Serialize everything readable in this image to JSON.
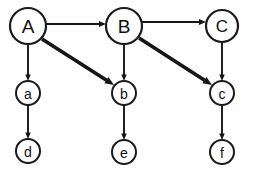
{
  "diagram": {
    "type": "directed-graph",
    "canvas": {
      "width": 254,
      "height": 175,
      "background": "#fefefe"
    },
    "style": {
      "node_fill": "#ffffff",
      "node_stroke": "#1a1a1a",
      "label_color": "#111111",
      "edge_color": "#161616",
      "thin_edge_width": 1.9,
      "thick_edge_width": 3.6,
      "major_node_stroke_width": 2.2,
      "minor_node_stroke_width": 2.0
    },
    "nodes": [
      {
        "id": "A",
        "label": "A",
        "cx": 28,
        "cy": 26,
        "r": 18,
        "tier": "major",
        "font_size": 19,
        "stroke_width": 2.2
      },
      {
        "id": "B",
        "label": "B",
        "cx": 124,
        "cy": 26,
        "r": 18,
        "tier": "major",
        "font_size": 19,
        "stroke_width": 2.2
      },
      {
        "id": "C",
        "label": "C",
        "cx": 222,
        "cy": 26,
        "r": 16,
        "tier": "major",
        "font_size": 17,
        "stroke_width": 2.2
      },
      {
        "id": "a",
        "label": "a",
        "cx": 28,
        "cy": 93,
        "r": 12,
        "tier": "minor",
        "font_size": 14,
        "stroke_width": 2.0
      },
      {
        "id": "b",
        "label": "b",
        "cx": 124,
        "cy": 93,
        "r": 12,
        "tier": "minor",
        "font_size": 14,
        "stroke_width": 2.0
      },
      {
        "id": "c",
        "label": "c",
        "cx": 222,
        "cy": 93,
        "r": 12,
        "tier": "minor",
        "font_size": 14,
        "stroke_width": 2.0
      },
      {
        "id": "d",
        "label": "d",
        "cx": 28,
        "cy": 151,
        "r": 12,
        "tier": "minor",
        "font_size": 14,
        "stroke_width": 2.0
      },
      {
        "id": "e",
        "label": "e",
        "cx": 124,
        "cy": 152,
        "r": 12,
        "tier": "minor",
        "font_size": 14,
        "stroke_width": 2.0
      },
      {
        "id": "f",
        "label": "f",
        "cx": 222,
        "cy": 152,
        "r": 12,
        "tier": "minor",
        "font_size": 14,
        "stroke_width": 2.0
      }
    ],
    "edges": [
      {
        "id": "A-B",
        "from": "A",
        "to": "B",
        "kind": "horizontal",
        "weight": "thin",
        "x1": 46,
        "y1": 24,
        "x2": 106,
        "y2": 24,
        "width": 1.9,
        "head": 7.0
      },
      {
        "id": "B-C",
        "from": "B",
        "to": "C",
        "kind": "horizontal",
        "weight": "thin",
        "x1": 142,
        "y1": 22,
        "x2": 206,
        "y2": 22,
        "width": 1.9,
        "head": 7.0
      },
      {
        "id": "A-a",
        "from": "A",
        "to": "a",
        "kind": "vertical",
        "weight": "thin",
        "x1": 28,
        "y1": 44,
        "x2": 28,
        "y2": 81,
        "width": 1.9,
        "head": 6.5
      },
      {
        "id": "a-d",
        "from": "a",
        "to": "d",
        "kind": "vertical",
        "weight": "thin",
        "x1": 28,
        "y1": 105,
        "x2": 28,
        "y2": 139,
        "width": 1.9,
        "head": 6.5
      },
      {
        "id": "B-b",
        "from": "B",
        "to": "b",
        "kind": "vertical",
        "weight": "thin",
        "x1": 124,
        "y1": 44,
        "x2": 124,
        "y2": 81,
        "width": 1.9,
        "head": 6.5
      },
      {
        "id": "b-e",
        "from": "b",
        "to": "e",
        "kind": "vertical",
        "weight": "thin",
        "x1": 124,
        "y1": 105,
        "x2": 124,
        "y2": 140,
        "width": 1.9,
        "head": 6.5
      },
      {
        "id": "C-c",
        "from": "C",
        "to": "c",
        "kind": "vertical",
        "weight": "thin",
        "x1": 222,
        "y1": 42,
        "x2": 222,
        "y2": 81,
        "width": 1.9,
        "head": 6.5
      },
      {
        "id": "c-f",
        "from": "c",
        "to": "f",
        "kind": "vertical",
        "weight": "thin",
        "x1": 222,
        "y1": 105,
        "x2": 222,
        "y2": 140,
        "width": 1.9,
        "head": 6.5
      },
      {
        "id": "A-b",
        "from": "A",
        "to": "b",
        "kind": "diagonal",
        "weight": "thick",
        "x1": 42,
        "y1": 39,
        "x2": 114,
        "y2": 85,
        "width": 3.6,
        "head": 9.0
      },
      {
        "id": "B-c",
        "from": "B",
        "to": "c",
        "kind": "diagonal",
        "weight": "thick",
        "x1": 139,
        "y1": 38,
        "x2": 212,
        "y2": 85,
        "width": 3.6,
        "head": 9.0
      }
    ]
  }
}
